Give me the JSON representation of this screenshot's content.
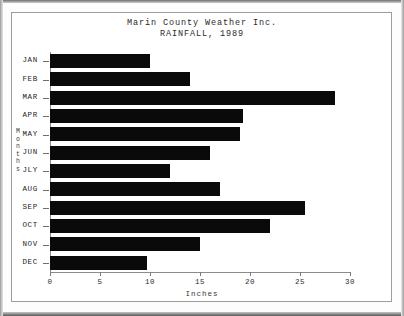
{
  "chart_data": {
    "type": "bar",
    "orientation": "horizontal",
    "title": "Marin County Weather Inc.",
    "subtitle": "RAINFALL, 1989",
    "xlabel": "Inches",
    "ylabel": "Months",
    "categories": [
      "JAN",
      "FEB",
      "MAR",
      "APR",
      "MAY",
      "JUN",
      "JLY",
      "AUG",
      "SEP",
      "OCT",
      "NOV",
      "DEC"
    ],
    "values": [
      10.0,
      14.0,
      28.5,
      19.3,
      19.0,
      16.0,
      12.0,
      17.0,
      25.5,
      22.0,
      15.0,
      9.7
    ],
    "xlim": [
      0,
      30
    ],
    "xticks": [
      0,
      5,
      10,
      15,
      20,
      25,
      30
    ],
    "xticklabels": [
      "0",
      "5",
      "10",
      "15",
      "20",
      "25",
      "30"
    ],
    "grid": false,
    "legend": false,
    "bar_color": "#0a0a0a",
    "background_color": "#ffffff",
    "frame_color": "#9d9d9d"
  },
  "ylabel_chars": [
    "M",
    "o",
    "n",
    "t",
    "h",
    "s"
  ]
}
